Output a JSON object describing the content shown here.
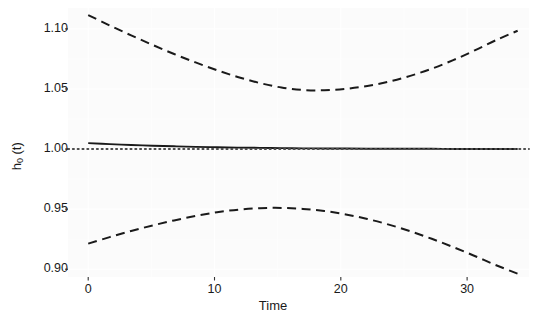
{
  "chart_data": {
    "type": "line",
    "title": "",
    "xlabel": "Time",
    "ylabel": "h0 (t)",
    "ylabel_base": "h",
    "ylabel_sub": "0",
    "ylabel_tail": " (t)",
    "xlim": [
      -1.6,
      34.9
    ],
    "ylim": [
      0.8935,
      1.1174
    ],
    "xticks": [
      0,
      10,
      20,
      30
    ],
    "xtick_labels": [
      "0",
      "10",
      "20",
      "30"
    ],
    "yticks": [
      0.9,
      0.95,
      1.0,
      1.05,
      1.1
    ],
    "ytick_labels": [
      "0.90",
      "0.95",
      "1.00",
      "1.05",
      "1.10"
    ],
    "grid": true,
    "grid_color": "#ffffff",
    "panel_background": "#fbfbfb",
    "legend": "none",
    "series": [
      {
        "name": "upper confidence band",
        "style": "dashed",
        "color": "#1a1a1a",
        "x": [
          0,
          1.7,
          3.4,
          5.1,
          6.8,
          8.5,
          10.2,
          11.9,
          13.6,
          15.3,
          17,
          18.7,
          20.4,
          22.1,
          23.8,
          25.5,
          27.2,
          28.9,
          30.6,
          32.3,
          34
        ],
        "y": [
          1.1115,
          1.1029,
          1.0946,
          1.0867,
          1.0791,
          1.0721,
          1.0656,
          1.0598,
          1.0549,
          1.0512,
          1.0492,
          1.0489,
          1.0501,
          1.0525,
          1.0561,
          1.0609,
          1.0669,
          1.074,
          1.0821,
          1.0907,
          1.0985
        ]
      },
      {
        "name": "estimated baseline hazard",
        "style": "solid",
        "color": "#1a1a1a",
        "x": [
          0,
          1.7,
          3.4,
          5.1,
          6.8,
          8.5,
          10.2,
          11.9,
          13.6,
          15.3,
          17,
          18.7,
          20.4,
          22.1,
          23.8,
          25.5,
          27.2,
          28.9,
          30.6,
          32.3,
          34
        ],
        "y": [
          1.0049,
          1.0041,
          1.0034,
          1.0028,
          1.0023,
          1.0018,
          1.0015,
          1.0012,
          1.001,
          1.0008,
          1.0006,
          1.0005,
          1.0004,
          1.0003,
          1.0003,
          1.0002,
          1.0002,
          1.0001,
          1.0001,
          1.0001,
          1.0001
        ]
      },
      {
        "name": "lower confidence band",
        "style": "dashed",
        "color": "#1a1a1a",
        "x": [
          0,
          1.7,
          3.4,
          5.1,
          6.8,
          8.5,
          10.2,
          11.9,
          13.6,
          15.3,
          17,
          18.7,
          20.4,
          22.1,
          23.8,
          25.5,
          27.2,
          28.9,
          30.6,
          32.3,
          34
        ],
        "y": [
          0.9213,
          0.9267,
          0.9318,
          0.9364,
          0.9406,
          0.9443,
          0.9474,
          0.9496,
          0.9508,
          0.951,
          0.9502,
          0.9484,
          0.9456,
          0.9418,
          0.9371,
          0.9316,
          0.9253,
          0.9184,
          0.911,
          0.9033,
          0.8963
        ]
      },
      {
        "name": "reference line",
        "style": "dotted",
        "color": "#4d4d4d",
        "x": [
          -1.6,
          34.9
        ],
        "y": [
          1.0,
          1.0
        ]
      }
    ]
  },
  "panel": {
    "left_px": 68,
    "right_px": 529,
    "top_px": 8,
    "bottom_px": 277
  }
}
